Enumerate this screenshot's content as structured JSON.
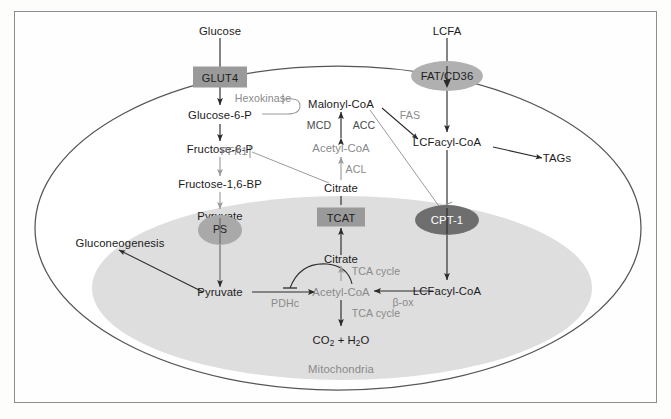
{
  "figure": {
    "cell_label": "",
    "organelle_label": "Mitochondria"
  },
  "colors": {
    "transporter_box": "#9a9a9a",
    "membrane_oval_light": "#b0b0b0",
    "membrane_oval_dark": "#6e6e6e",
    "mitochondria_fill": "#dedede",
    "cell_outline": "#555555",
    "arrow_dark": "#2a2a2a",
    "arrow_gray": "#9b9b9b",
    "text_dark": "#1b1b1b",
    "text_gray": "#8a8a8a",
    "frame": "#8d8d8d"
  },
  "metabolites": {
    "glucose": "Glucose",
    "lcfa": "LCFA",
    "glucose_6_p": "Glucose-6-P",
    "fructose_6_p": "Fructose-6-P",
    "fructose_16_bp": "Fructose-1,6-BP",
    "pyruvate_cyto": "Pyruvate",
    "pyruvate_mito": "Pyruvate",
    "gluconeogenesis": "Gluconeogenesis",
    "malonyl_coa": "Malonyl-CoA",
    "acetyl_coa_cyto": "Acetyl-CoA",
    "citrate_cyto": "Citrate",
    "citrate_mito": "Citrate",
    "acetyl_coa_mito": "Acetyl-CoA",
    "lcfacyl_coa_cyto": "LCFacyl-CoA",
    "lcfacyl_coa_mito": "LCFacyl-CoA",
    "tags": "TAGs",
    "co2_h2o_prefix": "CO",
    "co2_h2o_sub1": "2",
    "co2_h2o_mid": " + H",
    "co2_h2o_sub2": "2",
    "co2_h2o_suffix": "O"
  },
  "transporters": [
    {
      "name": "GLUT4",
      "label": "GLUT4",
      "shape": "box"
    },
    {
      "name": "TCAT",
      "label": "TCAT",
      "shape": "box"
    },
    {
      "name": "FAT/CD36",
      "label": "FAT/CD36",
      "shape": "oval-light"
    },
    {
      "name": "PS",
      "label": "PS",
      "shape": "oval-light"
    },
    {
      "name": "CPT-1",
      "label": "CPT-1",
      "shape": "oval-dark"
    }
  ],
  "enzymes": {
    "hexokinase": "Hexokinase",
    "pfk1": "PFK1",
    "mcd": "MCD",
    "acc": "ACC",
    "acl": "ACL",
    "fas": "FAS",
    "pdhc": "PDHc",
    "beta_ox": "β-ox",
    "tca_cycle_upper": "TCA cycle",
    "tca_cycle_lower": "TCA cycle"
  }
}
